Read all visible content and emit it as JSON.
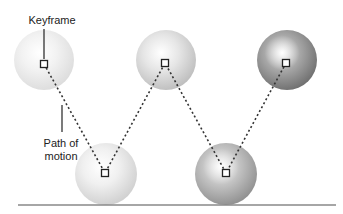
{
  "diagram": {
    "labels": {
      "keyframe": "Keyframe",
      "path_of_motion_line1": "Path of",
      "path_of_motion_line2": "motion"
    },
    "keyframes": [
      {
        "x": 44,
        "y": 64,
        "sphere_cx": 44,
        "sphere_cy": 60,
        "r": 30,
        "shade": "#f2f2f2",
        "edge": "#dcdcdc"
      },
      {
        "x": 105,
        "y": 173,
        "sphere_cx": 106,
        "sphere_cy": 174,
        "r": 31,
        "shade": "#f0f0f0",
        "edge": "#cfcfcf"
      },
      {
        "x": 165,
        "y": 63,
        "sphere_cx": 166,
        "sphere_cy": 60,
        "r": 30,
        "shade": "#e6e6e6",
        "edge": "#bdbdbd"
      },
      {
        "x": 226,
        "y": 173,
        "sphere_cx": 226,
        "sphere_cy": 174,
        "r": 31,
        "shade": "#c4c4c4",
        "edge": "#8f8f8f"
      },
      {
        "x": 286,
        "y": 63,
        "sphere_cx": 287,
        "sphere_cy": 60,
        "r": 30,
        "shade": "#a8a8a8",
        "edge": "#6e6e6e"
      }
    ],
    "ground": {
      "x1": 18,
      "x2": 336,
      "y": 205,
      "color": "#888888"
    },
    "colors": {
      "path": "#333333",
      "marker": "#222222",
      "leader": "#222222"
    }
  }
}
